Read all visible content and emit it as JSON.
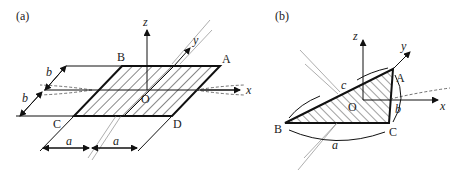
{
  "figure_a": {
    "panel_label": "(a)",
    "vertices": {
      "A": "A",
      "B": "B",
      "C": "C",
      "D": "D",
      "O": "O"
    },
    "axes": {
      "x": "x",
      "y": "y",
      "z": "z"
    },
    "dimensions": {
      "b_upper": "b",
      "b_lower": "b",
      "a_left": "a",
      "a_right": "a"
    }
  },
  "figure_b": {
    "panel_label": "(b)",
    "vertices": {
      "A": "A",
      "B": "B",
      "C": "C",
      "O": "O"
    },
    "axes": {
      "x": "x",
      "y": "y",
      "z": "z"
    },
    "dimensions": {
      "a": "a",
      "b": "b",
      "c": "c"
    }
  }
}
